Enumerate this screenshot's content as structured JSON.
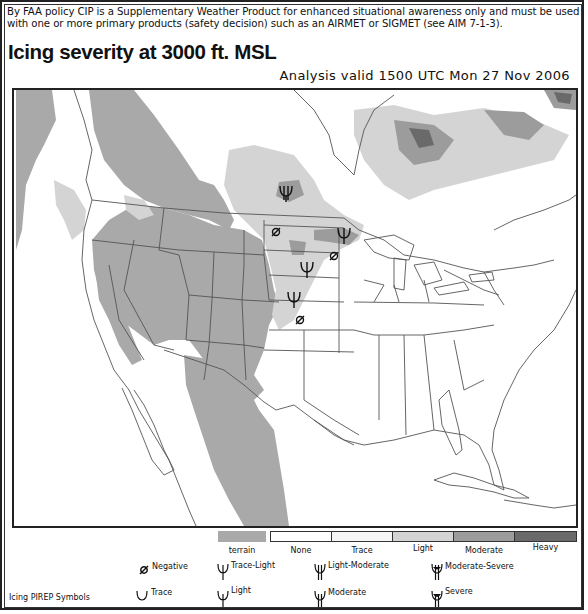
{
  "header": {
    "disclaimer": "By FAA policy CIP is a Supplementary Weather Product for enhanced situational awareness only and must be used with one or more primary products (safety decision) such as an AIRMET or SIGMET (see AIM 7-1-3).",
    "title": "Icing severity at 3000 ft. MSL",
    "valid_time": "Analysis valid 1500 UTC Mon 27 Nov 2006"
  },
  "colors": {
    "terrain": "#a9a9a9",
    "none": "#ffffff",
    "trace": "#f6f6f6",
    "light": "#d4d4d4",
    "moderate": "#9c9c9c",
    "heavy": "#6a6a6a",
    "boundary": "#555555"
  },
  "legend": {
    "severity": [
      {
        "key": "terrain",
        "label": "terrain"
      },
      {
        "key": "none",
        "label": "None"
      },
      {
        "key": "trace",
        "label": "Trace"
      },
      {
        "key": "light",
        "label": "Light"
      },
      {
        "key": "moderate",
        "label": "Moderate"
      },
      {
        "key": "heavy",
        "label": "Heavy"
      }
    ],
    "pirep_title": "Icing PIREP Symbols",
    "pirep_symbols": [
      {
        "key": "negative",
        "label": "Negative",
        "icon": "negative-icon"
      },
      {
        "key": "trace-light",
        "label": "Trace-Light",
        "icon": "trace-light-icon"
      },
      {
        "key": "light-moderate",
        "label": "Light-Moderate",
        "icon": "light-moderate-icon"
      },
      {
        "key": "moderate-severe",
        "label": "Moderate-Severe",
        "icon": "moderate-severe-icon"
      },
      {
        "key": "trace",
        "label": "Trace",
        "icon": "trace-icon"
      },
      {
        "key": "light",
        "label": "Light",
        "icon": "light-icon"
      },
      {
        "key": "moderate",
        "label": "Moderate",
        "icon": "moderate-icon"
      },
      {
        "key": "severe",
        "label": "Severe",
        "icon": "severe-icon"
      }
    ]
  },
  "map": {
    "pireps": [
      {
        "type": "moderate",
        "x": 272,
        "y": 104,
        "region": "southern Saskatchewan/Manitoba border"
      },
      {
        "type": "negative",
        "x": 262,
        "y": 142,
        "region": "North Dakota"
      },
      {
        "type": "light",
        "x": 330,
        "y": 147,
        "region": "northern Minnesota"
      },
      {
        "type": "negative",
        "x": 320,
        "y": 166,
        "region": "Minnesota"
      },
      {
        "type": "light",
        "x": 293,
        "y": 181,
        "region": "South Dakota/Minnesota"
      },
      {
        "type": "light",
        "x": 280,
        "y": 211,
        "region": "Nebraska"
      },
      {
        "type": "negative",
        "x": 286,
        "y": 230,
        "region": "Kansas/Nebraska"
      }
    ]
  }
}
